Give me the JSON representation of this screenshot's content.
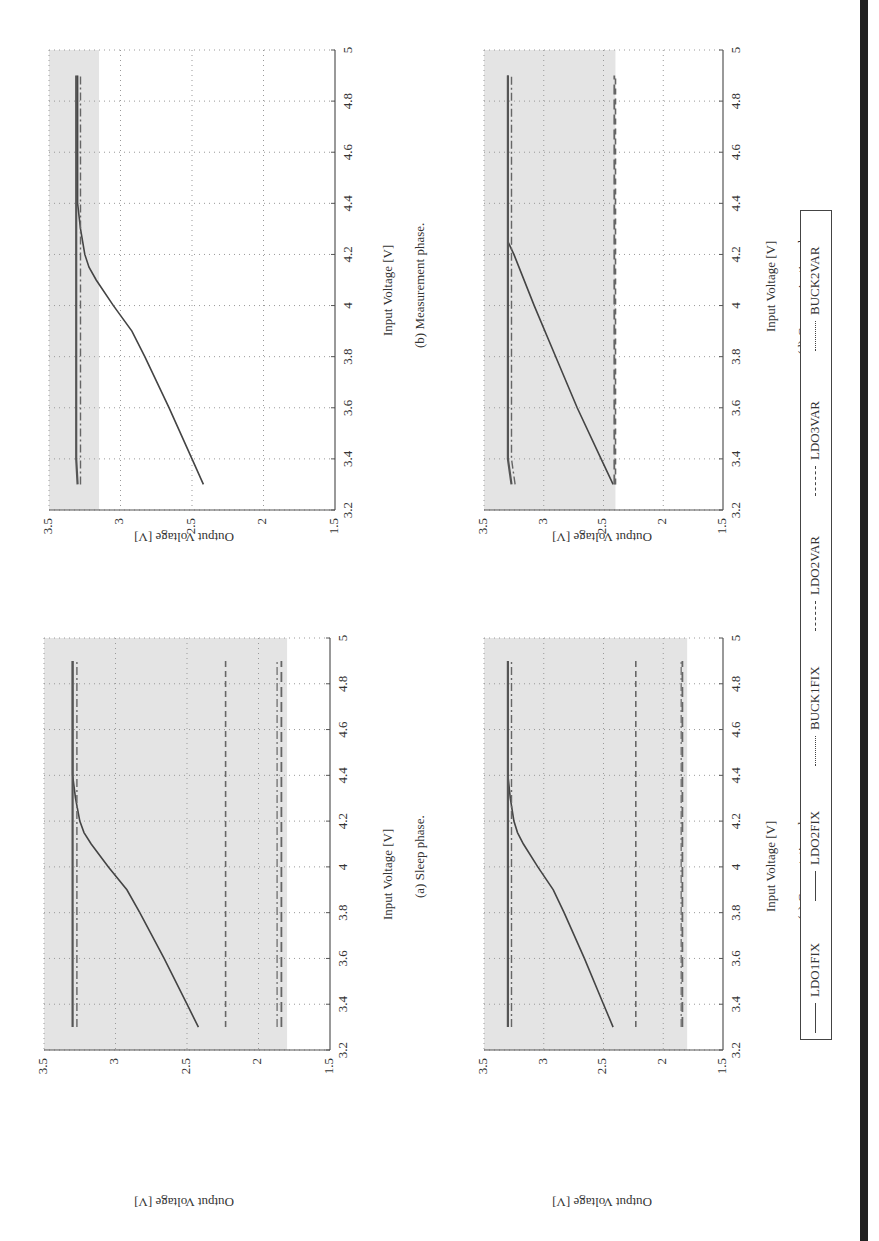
{
  "figure": {
    "orientation": "rotated 90 degrees",
    "legend": {
      "entries": [
        {
          "label": "LDO1FIX",
          "style": "solid"
        },
        {
          "label": "LDO2FIX",
          "style": "solid"
        },
        {
          "label": "BUCK1FIX",
          "style": "dashdot"
        },
        {
          "label": "LDO2VAR",
          "style": "dashed"
        },
        {
          "label": "LDO3VAR",
          "style": "longdash"
        },
        {
          "label": "BUCK2VAR",
          "style": "dashdot"
        }
      ]
    },
    "panels": [
      {
        "id": "b",
        "caption": "(b) Measurement phase.",
        "xlabel": "Input Voltage [V]",
        "ylabel": "Output Voltage [V]"
      },
      {
        "id": "d",
        "caption": "(d) Communication phase.",
        "xlabel": "Input Voltage [V]",
        "ylabel": "Output Voltage [V]"
      },
      {
        "id": "a",
        "caption": "(a) Sleep phase.",
        "xlabel": "Input Voltage [V]",
        "ylabel": "Output Voltage [V]"
      },
      {
        "id": "c",
        "caption": "(c) Computation phase.",
        "xlabel": "Input Voltage [V]",
        "ylabel": "Output Voltage [V]"
      }
    ],
    "xticks": [
      "3.2",
      "3.4",
      "3.6",
      "3.8",
      "4",
      "4.2",
      "4.4",
      "4.6",
      "4.8",
      "5"
    ],
    "yticks": [
      "1.5",
      "2",
      "2.5",
      "3",
      "3.5"
    ]
  },
  "chart_data": [
    {
      "type": "line",
      "title": "(a) Sleep phase.",
      "xlabel": "Input Voltage [V]",
      "ylabel": "Output Voltage [V]",
      "xlim": [
        3.2,
        5
      ],
      "ylim": [
        1.5,
        3.5
      ],
      "grid": true,
      "shaded_region": {
        "ymin": 1.8,
        "ymax": 3.5
      },
      "x": [
        3.3,
        3.4,
        3.6,
        3.8,
        3.9,
        4.0,
        4.1,
        4.15,
        4.2,
        4.3,
        4.4,
        4.6,
        4.8,
        4.9
      ],
      "series": [
        {
          "name": "LDO1FIX",
          "values": [
            2.42,
            2.5,
            2.66,
            2.83,
            2.92,
            3.05,
            3.17,
            3.22,
            3.25,
            3.28,
            3.3,
            3.3,
            3.3,
            3.3
          ]
        },
        {
          "name": "LDO2FIX",
          "values": [
            3.3,
            3.3,
            3.3,
            3.3,
            3.3,
            3.3,
            3.3,
            3.3,
            3.3,
            3.3,
            3.3,
            3.3,
            3.3,
            3.3
          ]
        },
        {
          "name": "BUCK1FIX",
          "values": [
            3.27,
            3.27,
            3.27,
            3.27,
            3.27,
            3.27,
            3.27,
            3.27,
            3.27,
            3.27,
            3.27,
            3.27,
            3.27,
            3.27
          ]
        },
        {
          "name": "LDO2VAR",
          "values": [
            2.23,
            2.23,
            2.23,
            2.23,
            2.23,
            2.23,
            2.23,
            2.23,
            2.23,
            2.23,
            2.23,
            2.23,
            2.23,
            2.23
          ]
        },
        {
          "name": "LDO3VAR",
          "values": [
            1.84,
            1.84,
            1.84,
            1.84,
            1.84,
            1.84,
            1.84,
            1.84,
            1.84,
            1.84,
            1.84,
            1.84,
            1.84,
            1.84
          ]
        },
        {
          "name": "BUCK2VAR",
          "values": [
            1.87,
            1.87,
            1.87,
            1.87,
            1.87,
            1.87,
            1.87,
            1.87,
            1.87,
            1.87,
            1.87,
            1.87,
            1.87,
            1.87
          ]
        }
      ]
    },
    {
      "type": "line",
      "title": "(b) Measurement phase.",
      "xlabel": "Input Voltage [V]",
      "ylabel": "Output Voltage [V]",
      "xlim": [
        3.2,
        5
      ],
      "ylim": [
        1.5,
        3.5
      ],
      "grid": true,
      "shaded_region": {
        "ymin": 3.15,
        "ymax": 3.5
      },
      "x": [
        3.3,
        3.4,
        3.6,
        3.8,
        3.9,
        4.0,
        4.1,
        4.15,
        4.2,
        4.3,
        4.4,
        4.6,
        4.8,
        4.9
      ],
      "series": [
        {
          "name": "LDO1FIX",
          "values": [
            2.42,
            2.5,
            2.66,
            2.83,
            2.92,
            3.05,
            3.17,
            3.22,
            3.25,
            3.28,
            3.3,
            3.3,
            3.3,
            3.3
          ]
        },
        {
          "name": "LDO2FIX",
          "values": [
            3.3,
            3.31,
            3.31,
            3.31,
            3.31,
            3.31,
            3.31,
            3.31,
            3.31,
            3.31,
            3.31,
            3.31,
            3.31,
            3.31
          ]
        },
        {
          "name": "BUCK1FIX",
          "values": [
            3.28,
            3.28,
            3.28,
            3.28,
            3.28,
            3.28,
            3.28,
            3.28,
            3.28,
            3.28,
            3.28,
            3.28,
            3.28,
            3.28
          ]
        }
      ]
    },
    {
      "type": "line",
      "title": "(c) Computation phase.",
      "xlabel": "Input Voltage [V]",
      "ylabel": "Output Voltage [V]",
      "xlim": [
        3.2,
        5
      ],
      "ylim": [
        1.5,
        3.5
      ],
      "grid": true,
      "shaded_region": {
        "ymin": 1.8,
        "ymax": 3.5
      },
      "x": [
        3.3,
        3.4,
        3.6,
        3.8,
        3.9,
        4.0,
        4.1,
        4.15,
        4.2,
        4.3,
        4.4,
        4.6,
        4.8,
        4.9
      ],
      "series": [
        {
          "name": "LDO1FIX",
          "values": [
            2.42,
            2.5,
            2.66,
            2.83,
            2.92,
            3.05,
            3.17,
            3.22,
            3.25,
            3.28,
            3.3,
            3.3,
            3.3,
            3.3
          ]
        },
        {
          "name": "LDO2FIX",
          "values": [
            3.3,
            3.3,
            3.3,
            3.3,
            3.3,
            3.3,
            3.3,
            3.3,
            3.3,
            3.3,
            3.3,
            3.3,
            3.3,
            3.3
          ]
        },
        {
          "name": "BUCK1FIX",
          "values": [
            3.27,
            3.27,
            3.27,
            3.27,
            3.27,
            3.27,
            3.27,
            3.27,
            3.27,
            3.27,
            3.27,
            3.27,
            3.27,
            3.27
          ]
        },
        {
          "name": "LDO2VAR",
          "values": [
            2.23,
            2.23,
            2.23,
            2.23,
            2.23,
            2.23,
            2.23,
            2.23,
            2.23,
            2.23,
            2.23,
            2.23,
            2.23,
            2.23
          ]
        },
        {
          "name": "LDO3VAR",
          "values": [
            1.84,
            1.84,
            1.84,
            1.84,
            1.84,
            1.84,
            1.84,
            1.84,
            1.84,
            1.84,
            1.84,
            1.84,
            1.84,
            1.84
          ]
        },
        {
          "name": "BUCK2VAR",
          "values": [
            1.85,
            1.85,
            1.85,
            1.85,
            1.85,
            1.85,
            1.85,
            1.85,
            1.85,
            1.85,
            1.85,
            1.85,
            1.85,
            1.85
          ]
        }
      ]
    },
    {
      "type": "line",
      "title": "(d) Communication phase.",
      "xlabel": "Input Voltage [V]",
      "ylabel": "Output Voltage [V]",
      "xlim": [
        3.2,
        5
      ],
      "ylim": [
        1.5,
        3.5
      ],
      "grid": true,
      "shaded_region": {
        "ymin": 2.4,
        "ymax": 3.5
      },
      "x": [
        3.3,
        3.4,
        3.6,
        3.8,
        4.0,
        4.2,
        4.25,
        4.3,
        4.4,
        4.6,
        4.8,
        4.9
      ],
      "series": [
        {
          "name": "LDO1FIX",
          "values": [
            2.42,
            2.52,
            2.72,
            2.9,
            3.08,
            3.25,
            3.3,
            3.3,
            3.3,
            3.3,
            3.3,
            3.3
          ]
        },
        {
          "name": "LDO2FIX",
          "values": [
            3.27,
            3.3,
            3.3,
            3.3,
            3.3,
            3.3,
            3.3,
            3.3,
            3.3,
            3.3,
            3.3,
            3.3
          ]
        },
        {
          "name": "BUCK1FIX",
          "values": [
            3.24,
            3.27,
            3.27,
            3.27,
            3.27,
            3.27,
            3.27,
            3.27,
            3.27,
            3.27,
            3.27,
            3.27
          ]
        },
        {
          "name": "LDO2VAR",
          "values": [
            2.4,
            2.4,
            2.4,
            2.4,
            2.4,
            2.4,
            2.4,
            2.4,
            2.4,
            2.4,
            2.4,
            2.4
          ]
        },
        {
          "name": "LDO3VAR",
          "values": [
            2.41,
            2.41,
            2.41,
            2.41,
            2.41,
            2.41,
            2.41,
            2.41,
            2.41,
            2.41,
            2.41,
            2.41
          ]
        }
      ]
    }
  ]
}
